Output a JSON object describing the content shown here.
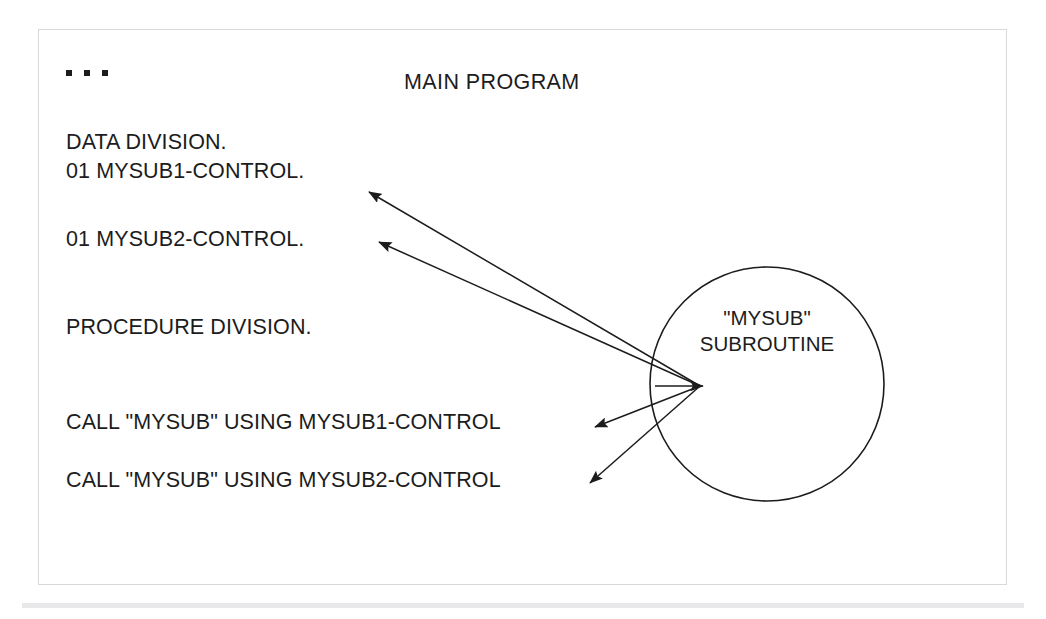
{
  "figure": {
    "title": "MAIN PROGRAM",
    "ellipsis": "...",
    "frame_color": "#d8d8d8",
    "text_color": "#1c1c1c",
    "stroke_color": "#1c1c1c",
    "background": "#ffffff"
  },
  "code_lines": [
    {
      "id": "data-division",
      "text": "DATA DIVISION."
    },
    {
      "id": "mysub1-control",
      "text": "01 MYSUB1-CONTROL."
    },
    {
      "id": "mysub2-control",
      "text": "01 MYSUB2-CONTROL."
    },
    {
      "id": "procedure-division",
      "text": "PROCEDURE DIVISION."
    },
    {
      "id": "call-1",
      "text": "CALL \"MYSUB\" USING MYSUB1-CONTROL"
    },
    {
      "id": "call-2",
      "text": "CALL \"MYSUB\" USING MYSUB2-CONTROL"
    }
  ],
  "subroutine": {
    "name_line": "\"MYSUB\"",
    "kind_line": "SUBROUTINE",
    "shape": "circle",
    "center_x": 767,
    "center_y": 384,
    "radius": 117
  },
  "connectors": [
    {
      "id": "arrow-to-mysub1-control",
      "from_x": 700,
      "from_y": 386,
      "to_x": 366,
      "to_y": 190
    },
    {
      "id": "arrow-to-mysub2-control",
      "from_x": 700,
      "from_y": 386,
      "to_x": 376,
      "to_y": 240
    },
    {
      "id": "arrow-to-call-1",
      "from_x": 700,
      "from_y": 386,
      "to_x": 592,
      "to_y": 427
    },
    {
      "id": "arrow-to-call-2",
      "from_x": 700,
      "from_y": 386,
      "to_x": 587,
      "to_y": 484
    },
    {
      "id": "arrow-into-subroutine",
      "from_x": 660,
      "from_y": 386,
      "to_x": 702,
      "to_y": 386
    }
  ],
  "bottom_strip": {
    "color": "#e7e7e9"
  }
}
